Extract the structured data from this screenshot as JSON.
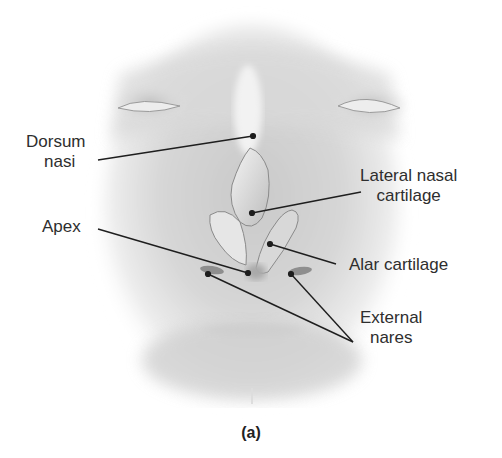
{
  "figure": {
    "caption": "(a)",
    "labels": [
      {
        "id": "dorsum-nasi",
        "line1": "Dorsum",
        "line2": "nasi",
        "x": 26,
        "y": 132,
        "point": [
          253,
          136
        ],
        "anchor": [
          98,
          160
        ]
      },
      {
        "id": "lateral-nasal-cartilage",
        "line1": "Lateral nasal",
        "line2": "cartilage",
        "x": 360,
        "y": 168,
        "point": [
          252,
          213
        ],
        "anchor": [
          361,
          192
        ]
      },
      {
        "id": "apex",
        "line1": "Apex",
        "line2": "",
        "x": 42,
        "y": 218,
        "point": [
          248,
          273
        ],
        "anchor": [
          98,
          229
        ]
      },
      {
        "id": "alar-cartilage",
        "line1": "Alar cartilage",
        "line2": "",
        "x": 350,
        "y": 256,
        "point": [
          270,
          244
        ],
        "anchor": [
          336,
          264
        ]
      },
      {
        "id": "external-nares",
        "line1": "External",
        "line2": "nares",
        "x": 360,
        "y": 310,
        "points": [
          [
            208,
            274
          ],
          [
            291,
            274
          ]
        ],
        "anchor": [
          353,
          342
        ]
      }
    ]
  }
}
